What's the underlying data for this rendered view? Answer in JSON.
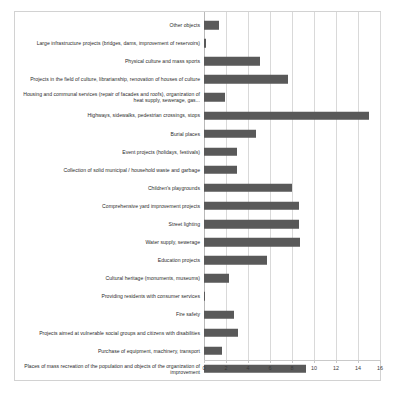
{
  "chart_data": {
    "type": "bar",
    "orientation": "horizontal",
    "title": "",
    "subtitle": "",
    "xlabel": "",
    "ylabel": "",
    "xlim": [
      0,
      16
    ],
    "xticks": [
      0,
      2,
      4,
      6,
      8,
      10,
      12,
      14,
      16
    ],
    "xtick_labels": [
      "0",
      "2",
      "4",
      "6",
      "8",
      "10",
      "12",
      "14",
      "16"
    ],
    "grid": true,
    "grid_axis": "x",
    "legend": false,
    "legend_position": "none",
    "bar_color": "#595959",
    "gridline_color": "#d9d9d9",
    "frame_color": "#d2d2d2",
    "categories": [
      "Other objects",
      "Large infrastructure projects (bridges, dams, improvement of reservoirs)",
      "Physical culture and mass sports",
      "Projects in the field of culture, librarianship, renovation of houses of culture",
      "Housing and communal services (repair of facades and roofs), organization of heat supply, sewerage, gas...",
      "Highways, sidewalks, pedestrian crossings, stops",
      "Burial places",
      "Event projects (holidays, festivals)",
      "Collection of solid municipal / household waste and garbage",
      "Children's playgrounds",
      "Comprehensive yard improvement projects",
      "Street lighting",
      "Water supply, sewerage",
      "Education projects",
      "Cultural heritage (monuments, museums)",
      "Providing residents with consumer services",
      "Fire safety",
      "Projects aimed at vulnerable social groups and citizens with disabilities",
      "Purchase of equipment, machinery, transport",
      "Places of mass recreation of the population and objects of the organization of improvement"
    ],
    "values": [
      1.4,
      0.15,
      5.1,
      7.6,
      1.9,
      15.0,
      4.7,
      3.0,
      3.0,
      8.0,
      8.6,
      8.6,
      8.7,
      5.7,
      2.3,
      0.1,
      2.7,
      3.1,
      1.6,
      9.3
    ]
  }
}
